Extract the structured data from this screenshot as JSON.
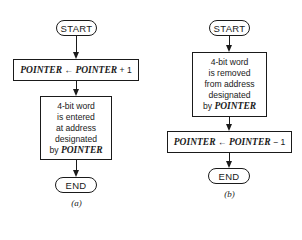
{
  "diagram_a": {
    "caption": "(a)",
    "start": "START",
    "step1": {
      "lhs": "POINTER",
      "arrow": "←",
      "rhs": "POINTER",
      "op": "+ 1"
    },
    "step2": {
      "lines": [
        "4-bit word",
        "is entered",
        "at address",
        "designated"
      ],
      "by": "by",
      "var": "POINTER"
    },
    "end": "END"
  },
  "diagram_b": {
    "caption": "(b)",
    "start": "START",
    "step1": {
      "lines": [
        "4-bit word",
        "is removed",
        "from address",
        "designated"
      ],
      "by": "by",
      "var": "POINTER"
    },
    "step2": {
      "lhs": "POINTER",
      "arrow": "←",
      "rhs": "POINTER",
      "op": "− 1"
    },
    "end": "END"
  }
}
